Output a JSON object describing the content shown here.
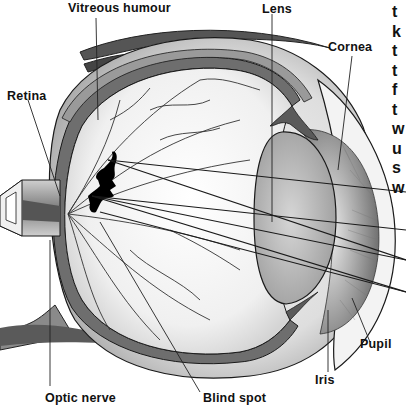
{
  "diagram": {
    "labels": {
      "vitreous_humour": "Vitreous humour",
      "lens": "Lens",
      "cornea": "Cornea",
      "retina": "Retina",
      "pupil": "Pupil",
      "iris": "Iris",
      "optic_nerve": "Optic nerve",
      "blind_spot": "Blind spot"
    },
    "edge_text_fragments": [
      "t",
      "k",
      "t",
      "t",
      "f",
      "t",
      "w",
      "u",
      "s",
      "w"
    ],
    "colors": {
      "background": "#ffffff",
      "outline": "#1a1a1a",
      "sclera": "#e6e6e6",
      "choroid": "#6e6e6e",
      "iris": "#8a8a8a",
      "lens": "#bdbdbd",
      "image_silhouette": "#000000"
    }
  }
}
